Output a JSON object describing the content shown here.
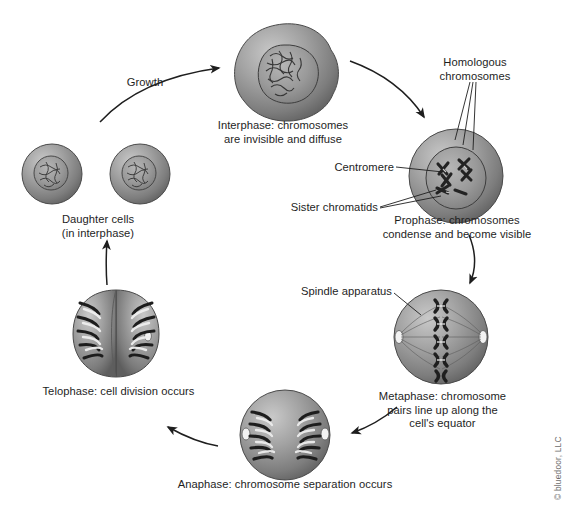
{
  "figure": {
    "credit": "© bluedoor, LLC",
    "background_color": "#ffffff",
    "cell_fill_color": "#8c8c8c",
    "chromosome_color": "#2b2b2b",
    "line_color": "#1e1e1e"
  },
  "stages": [
    {
      "id": "interphase",
      "label": "Interphase: chromosomes\nare invisible and diffuse",
      "position": {
        "x": 283,
        "y": 74
      }
    },
    {
      "id": "prophase",
      "label": "Prophase: chromosomes\ncondense and become visible",
      "position": {
        "x": 456,
        "y": 178
      }
    },
    {
      "id": "metaphase",
      "label": "Metaphase: chromosome\npairs line up along the\ncell's equator",
      "position": {
        "x": 441,
        "y": 339
      }
    },
    {
      "id": "anaphase",
      "label": "Anaphase: chromosome separation occurs",
      "position": {
        "x": 285,
        "y": 437
      }
    },
    {
      "id": "telophase",
      "label": "Telophase: cell division occurs",
      "position": {
        "x": 116,
        "y": 334
      }
    },
    {
      "id": "daughter-cells",
      "label": "Daughter cells\n(in interphase)",
      "position": {
        "x": 117,
        "y": 178
      }
    }
  ],
  "annotations": [
    {
      "id": "growth",
      "label": "Growth"
    },
    {
      "id": "homologous-chromosomes",
      "label": "Homologous\nchromosomes"
    },
    {
      "id": "centromere",
      "label": "Centromere"
    },
    {
      "id": "sister-chromatids",
      "label": "Sister chromatids"
    },
    {
      "id": "spindle-apparatus",
      "label": "Spindle apparatus"
    }
  ],
  "arrows": [
    {
      "id": "arrow-growth",
      "from": "daughter-cells",
      "to": "interphase"
    },
    {
      "id": "arrow-interphase-prophase",
      "from": "interphase",
      "to": "prophase"
    },
    {
      "id": "arrow-prophase-metaphase",
      "from": "prophase",
      "to": "metaphase"
    },
    {
      "id": "arrow-metaphase-anaphase",
      "from": "metaphase",
      "to": "anaphase"
    },
    {
      "id": "arrow-anaphase-telophase",
      "from": "anaphase",
      "to": "telophase"
    },
    {
      "id": "arrow-telophase-daughter",
      "from": "telophase",
      "to": "daughter-cells"
    }
  ]
}
